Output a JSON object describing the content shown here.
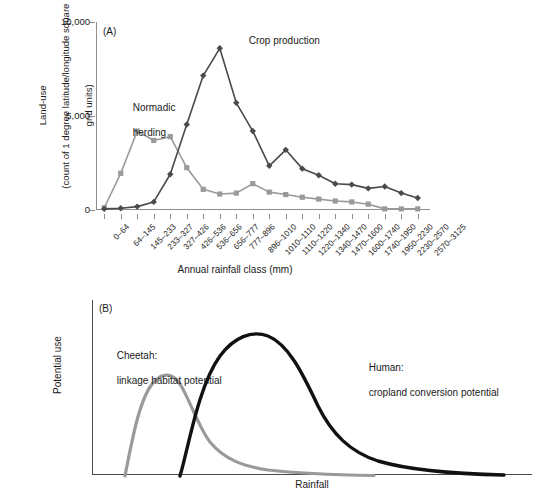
{
  "figure": {
    "page_number": "",
    "panel_a_tag": "(A)",
    "panel_b_tag": "(B)"
  },
  "panel_a": {
    "tag": "(A)",
    "x_axis_title": "Annual rainfall class (mm)",
    "y_axis_title_line1": "Land-use",
    "y_axis_title_line2": "(count of 1 degree latitude/longitude square",
    "y_axis_title_line3": "grid units)",
    "y_axis_title": "Land-use (count of 1 degree latitude/longitude square grid units)",
    "annotations": [
      {
        "name": "normadic-herding",
        "line1": "Normadic",
        "line2": "herding",
        "color": "#9a9a9a"
      },
      {
        "name": "crop-production",
        "line1": "Crop production",
        "line2": "",
        "color": "#4a4a4a"
      }
    ]
  },
  "panel_b": {
    "tag": "(B)",
    "x_axis_title": "Rainfall",
    "y_axis_title": "Potential use",
    "annotations": [
      {
        "name": "cheetah",
        "line1": "Cheetah:",
        "line2": "linkage habitat potential",
        "color": "#9a9a9a"
      },
      {
        "name": "human",
        "line1": "Human:",
        "line2": "cropland conversion potential",
        "color": "#111111"
      }
    ]
  },
  "chart_data": [
    {
      "panel": "A",
      "type": "line",
      "title": "",
      "xlabel": "Annual rainfall class (mm)",
      "ylabel": "Land-use (count of 1 degree latitude/longitude square grid units)",
      "ylim": [
        0,
        10000
      ],
      "yticks": [
        0,
        5000,
        10000
      ],
      "ytick_labels": [
        "0",
        "5,000",
        "10,000"
      ],
      "grid": false,
      "legend": "inline annotations",
      "categories": [
        "0–64",
        "64–145",
        "145–233",
        "233–327",
        "327–426",
        "426–536",
        "536–656",
        "656–777",
        "777–896",
        "896–1010",
        "1010–1110",
        "1110–1220",
        "1220–1340",
        "1340–1470",
        "1470–1600",
        "1600–1740",
        "1740–1950",
        "1950–2230",
        "2230–2570",
        "2570–3125"
      ],
      "series": [
        {
          "name": "Normadic herding",
          "marker": "square",
          "color": "#9a9a9a",
          "values": [
            120,
            1950,
            4200,
            3700,
            3900,
            2250,
            1100,
            850,
            900,
            1400,
            950,
            820,
            680,
            580,
            480,
            430,
            310,
            60,
            60,
            60
          ]
        },
        {
          "name": "Crop production",
          "marker": "diamond",
          "color": "#4a4a4a",
          "values": [
            60,
            90,
            180,
            430,
            1900,
            4550,
            7150,
            8600,
            5700,
            4200,
            2350,
            3200,
            2200,
            1850,
            1400,
            1350,
            1150,
            1250,
            900,
            640
          ]
        }
      ]
    },
    {
      "panel": "B",
      "type": "line",
      "title": "",
      "xlabel": "Rainfall",
      "ylabel": "Potential use",
      "axes_unlabeled": true,
      "grid": false,
      "series": [
        {
          "name": "Cheetah: linkage habitat potential",
          "color": "#9a9a9a",
          "description": "Left-shifted skewed unimodal curve peaking early at low rainfall then decaying to a long low tail."
        },
        {
          "name": "Human: cropland conversion potential",
          "color": "#111111",
          "description": "Right-shifted taller skewed unimodal curve peaking at mid rainfall with a long decaying tail."
        }
      ]
    }
  ]
}
